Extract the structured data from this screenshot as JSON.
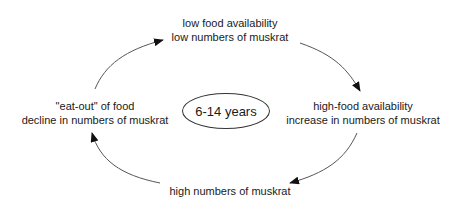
{
  "diagram": {
    "type": "cycle",
    "center": {
      "label": "6-14 years"
    },
    "nodes": {
      "top": {
        "line1": "low food availability",
        "line2": "low numbers of muskrat"
      },
      "right": {
        "line1": "high-food availability",
        "line2": "increase in numbers of muskrat"
      },
      "bottom": {
        "line1": "high numbers of muskrat"
      },
      "left": {
        "line1": "\"eat-out\" of food",
        "line2": "decline in numbers of muskrat"
      }
    },
    "edges": [
      {
        "from": "top",
        "to": "right",
        "direction": "clockwise"
      },
      {
        "from": "right",
        "to": "bottom",
        "direction": "clockwise"
      },
      {
        "from": "bottom",
        "to": "left",
        "direction": "clockwise"
      },
      {
        "from": "left",
        "to": "top",
        "direction": "clockwise"
      }
    ],
    "colors": {
      "text": "#1a1a1a",
      "line": "#555555",
      "arrowhead": "#111111",
      "background": "#ffffff"
    }
  }
}
